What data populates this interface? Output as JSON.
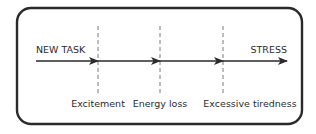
{
  "diagram": {
    "title": "",
    "start_label": "NEW TASK",
    "end_label": "STRESS",
    "stages": [
      {
        "label": "Excitement",
        "x": 98
      },
      {
        "label": "Energy loss",
        "x": 160
      },
      {
        "label": "Excessive tiredness",
        "x": 223
      }
    ],
    "arrow": {
      "x_start": 36,
      "x_end": 287,
      "y": 61
    },
    "frame": {
      "x": 17,
      "y": 8,
      "width": 285,
      "height": 116,
      "radius": 14
    },
    "colors": {
      "stroke": "#2a2a2a",
      "dashed": "#7a7a7a",
      "text": "#2b2b2b",
      "background": "#ffffff"
    }
  }
}
